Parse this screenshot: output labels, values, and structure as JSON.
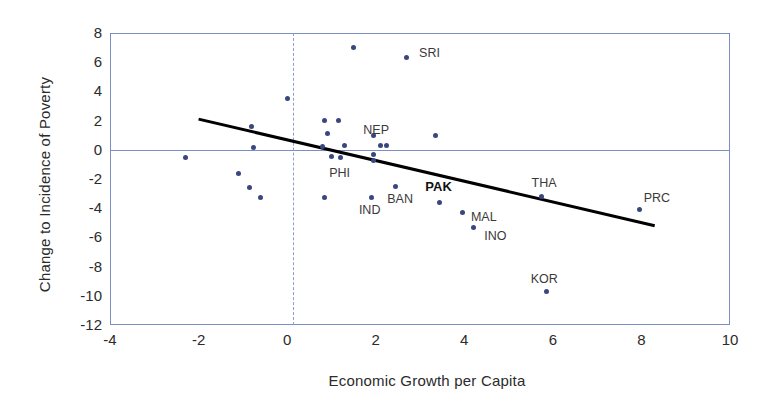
{
  "chart_data": {
    "type": "scatter",
    "title": "",
    "xlabel": "Economic Growth per Capita",
    "ylabel": "Change to Incidence of Poverty",
    "xlim": [
      -4,
      10
    ],
    "ylim": [
      -12,
      8
    ],
    "xticks": [
      "-4",
      "-2",
      "0",
      "2",
      "4",
      "6",
      "8",
      "10"
    ],
    "yticks": [
      "8",
      "6",
      "4",
      "2",
      "0",
      "-2",
      "-4",
      "-6",
      "-8",
      "-10",
      "-12"
    ],
    "grid": false,
    "legend": "none",
    "reference_lines": [
      {
        "name": "zero-horizontal",
        "orientation": "horizontal",
        "value": 0,
        "style": "solid",
        "color": "#7b8fc4"
      },
      {
        "name": "zero-vertical",
        "orientation": "vertical",
        "value": 0,
        "style": "dashed",
        "color": "#8f9fcb"
      }
    ],
    "trendline": {
      "name": "linear-fit",
      "x0": -2.0,
      "y0": 2.1,
      "x1": 8.3,
      "y1": -5.2,
      "color": "#000000",
      "width": 3
    },
    "marker_color": "#39477f",
    "points": [
      {
        "label": "",
        "x": -2.3,
        "y": -0.5
      },
      {
        "label": "",
        "x": -0.8,
        "y": 1.6
      },
      {
        "label": "",
        "x": -0.75,
        "y": 0.15
      },
      {
        "label": "",
        "x": -1.1,
        "y": -1.6
      },
      {
        "label": "",
        "x": -0.85,
        "y": -2.6
      },
      {
        "label": "",
        "x": -0.6,
        "y": -3.3
      },
      {
        "label": "",
        "x": 0.0,
        "y": 3.5
      },
      {
        "label": "",
        "x": 0.85,
        "y": 2.0
      },
      {
        "label": "",
        "x": 1.15,
        "y": 2.0
      },
      {
        "label": "",
        "x": 0.9,
        "y": 1.1
      },
      {
        "label": "",
        "x": 0.8,
        "y": 0.2
      },
      {
        "label": "",
        "x": 1.3,
        "y": 0.3
      },
      {
        "label": "",
        "x": 1.0,
        "y": -0.45
      },
      {
        "label": "",
        "x": 1.5,
        "y": 7.0
      },
      {
        "label": "SRI",
        "x": 2.7,
        "y": 6.3
      },
      {
        "label": "NEP",
        "x": 1.95,
        "y": 1.0
      },
      {
        "label": "",
        "x": 2.1,
        "y": 0.3
      },
      {
        "label": "",
        "x": 2.25,
        "y": 0.3
      },
      {
        "label": "",
        "x": 1.95,
        "y": -0.3
      },
      {
        "label": "",
        "x": 1.95,
        "y": -0.7
      },
      {
        "label": "PHI",
        "x": 1.2,
        "y": -0.5
      },
      {
        "label": "",
        "x": 3.35,
        "y": 1.0
      },
      {
        "label": "",
        "x": 0.85,
        "y": -3.3
      },
      {
        "label": "IND",
        "x": 1.9,
        "y": -3.3
      },
      {
        "label": "BAN",
        "x": 2.45,
        "y": -2.5
      },
      {
        "label": "PAK",
        "x": 3.45,
        "y": -3.6
      },
      {
        "label": "MAL",
        "x": 3.95,
        "y": -4.3
      },
      {
        "label": "INO",
        "x": 4.2,
        "y": -5.3
      },
      {
        "label": "THA",
        "x": 5.75,
        "y": -3.2
      },
      {
        "label": "KOR",
        "x": 5.85,
        "y": -9.7
      },
      {
        "label": "PRC",
        "x": 7.95,
        "y": -4.1
      }
    ],
    "point_labels": [
      {
        "name": "label-sri",
        "text": "SRI",
        "x": 2.98,
        "y": 6.55,
        "bold": false
      },
      {
        "name": "label-nep",
        "text": "NEP",
        "x": 1.72,
        "y": 1.3,
        "bold": false
      },
      {
        "name": "label-phi",
        "text": "PHI",
        "x": 0.95,
        "y": -1.65,
        "bold": false
      },
      {
        "name": "label-ind",
        "text": "IND",
        "x": 1.62,
        "y": -4.2,
        "bold": false
      },
      {
        "name": "label-ban",
        "text": "BAN",
        "x": 2.26,
        "y": -3.45,
        "bold": false
      },
      {
        "name": "label-pak",
        "text": "PAK",
        "x": 3.12,
        "y": -2.55,
        "bold": true
      },
      {
        "name": "label-mal",
        "text": "MAL",
        "x": 4.15,
        "y": -4.7,
        "bold": false
      },
      {
        "name": "label-ino",
        "text": "INO",
        "x": 4.45,
        "y": -5.95,
        "bold": false
      },
      {
        "name": "label-tha",
        "text": "THA",
        "x": 5.52,
        "y": -2.35,
        "bold": false
      },
      {
        "name": "label-kor",
        "text": "KOR",
        "x": 5.5,
        "y": -8.95,
        "bold": false
      },
      {
        "name": "label-prc",
        "text": "PRC",
        "x": 8.05,
        "y": -3.35,
        "bold": false
      }
    ]
  }
}
